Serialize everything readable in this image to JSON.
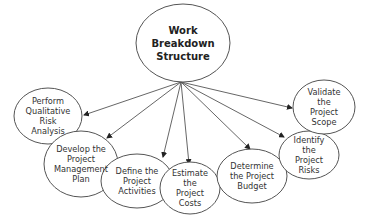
{
  "diagram": {
    "colors": {
      "stroke": "#555555",
      "fill": "#ffffff",
      "text": "#333333",
      "background": "#ffffff"
    },
    "root": {
      "id": "wbs",
      "lines": [
        "Work",
        "Breakdown",
        "Structure"
      ],
      "cx": 183,
      "cy": 43,
      "rx": 47,
      "ry": 39
    },
    "origin": {
      "x": 181,
      "y": 82
    },
    "nodes": [
      {
        "id": "perform-risk-analysis",
        "lines": [
          "Perform",
          "Qualitative",
          "Risk",
          "Analysis"
        ],
        "cx": 48,
        "cy": 116,
        "rx": 34,
        "ry": 28,
        "arrow_end": {
          "x": 84,
          "y": 115
        }
      },
      {
        "id": "develop-plan",
        "lines": [
          "Develop the",
          "Project",
          "Management",
          "Plan"
        ],
        "cx": 81,
        "cy": 164,
        "rx": 37,
        "ry": 33,
        "arrow_end": {
          "x": 107,
          "y": 138
        }
      },
      {
        "id": "define-activities",
        "lines": [
          "Define the",
          "Project",
          "Activities"
        ],
        "cx": 137,
        "cy": 181,
        "rx": 36,
        "ry": 27,
        "arrow_end": {
          "x": 163,
          "y": 157
        }
      },
      {
        "id": "estimate-costs",
        "lines": [
          "Estimate",
          "the",
          "Project",
          "Costs"
        ],
        "cx": 190,
        "cy": 188,
        "rx": 30,
        "ry": 26,
        "arrow_end": {
          "x": 189,
          "y": 164
        }
      },
      {
        "id": "determine-budget",
        "lines": [
          "Determine",
          "the Project",
          "Budget"
        ],
        "cx": 252,
        "cy": 176,
        "rx": 35,
        "ry": 27,
        "arrow_end": {
          "x": 250,
          "y": 149
        }
      },
      {
        "id": "identify-risks",
        "lines": [
          "Identify",
          "the",
          "Project",
          "Risks"
        ],
        "cx": 309,
        "cy": 155,
        "rx": 30,
        "ry": 24,
        "arrow_end": {
          "x": 284,
          "y": 137
        }
      },
      {
        "id": "validate-scope",
        "lines": [
          "Validate",
          "the",
          "Project",
          "Scope"
        ],
        "cx": 324,
        "cy": 107,
        "rx": 31,
        "ry": 27,
        "arrow_end": {
          "x": 292,
          "y": 108
        }
      }
    ]
  }
}
